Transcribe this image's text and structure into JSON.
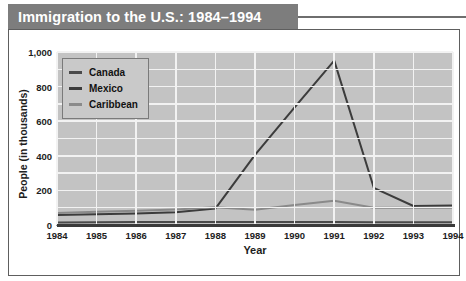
{
  "title": "Immigration to the U.S.: 1984–1994",
  "legend": {
    "position": "top-left-inside",
    "items": [
      {
        "label": "Canada",
        "color": "#4a4a4a"
      },
      {
        "label": "Mexico",
        "color": "#3c3c3c"
      },
      {
        "label": "Caribbean",
        "color": "#8a8a8a"
      }
    ]
  },
  "axes": {
    "x_title": "Year",
    "y_title": "People (in thousands)",
    "y_ticks": [
      "0",
      "200",
      "400",
      "600",
      "800",
      "1,000"
    ],
    "x_ticks": [
      "1984",
      "1985",
      "1986",
      "1987",
      "1988",
      "1989",
      "1990",
      "1991",
      "1992",
      "1993",
      "1994"
    ]
  },
  "colors": {
    "title_bar": "#7d7d7d",
    "title_text": "#ffffff",
    "plot_background": "#c3c3c3",
    "gridline": "#f2f2f2",
    "axis": "#3a3a3a",
    "frame": "#5e5e5e",
    "page_background": "#ffffff"
  },
  "chart_data": {
    "type": "line",
    "title": "Immigration to the U.S.: 1984–1994",
    "xlabel": "Year",
    "ylabel": "People (in thousands)",
    "categories": [
      "1984",
      "1985",
      "1986",
      "1987",
      "1988",
      "1989",
      "1990",
      "1991",
      "1992",
      "1993",
      "1994"
    ],
    "x": [
      1984,
      1985,
      1986,
      1987,
      1988,
      1989,
      1990,
      1991,
      1992,
      1993,
      1994
    ],
    "ylim": [
      0,
      1000
    ],
    "xlim": [
      1984,
      1994
    ],
    "grid": true,
    "legend_position": "upper left",
    "series": [
      {
        "name": "Canada",
        "color": "#4a4a4a",
        "values": [
          15,
          16,
          17,
          18,
          18,
          17,
          17,
          17,
          16,
          16,
          16
        ]
      },
      {
        "name": "Mexico",
        "color": "#3c3c3c",
        "values": [
          58,
          62,
          67,
          73,
          95,
          405,
          680,
          950,
          215,
          110,
          112
        ]
      },
      {
        "name": "Caribbean",
        "color": "#8a8a8a",
        "values": [
          70,
          76,
          83,
          90,
          102,
          88,
          115,
          140,
          100,
          100,
          100
        ]
      }
    ]
  }
}
